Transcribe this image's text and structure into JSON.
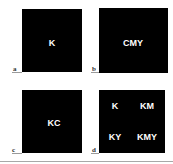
{
  "figure": {
    "background": "#ffffff",
    "panel_color": "#000000",
    "text_color": "#ffffff",
    "panels": [
      {
        "id": "a",
        "label": "a",
        "inks": [
          {
            "text": "K"
          }
        ]
      },
      {
        "id": "b",
        "label": "b",
        "inks": [
          {
            "text": "CMY"
          }
        ]
      },
      {
        "id": "c",
        "label": "c",
        "inks": [
          {
            "text": "KC"
          }
        ]
      },
      {
        "id": "d",
        "label": "d",
        "inks": [
          {
            "text": "K"
          },
          {
            "text": "KM"
          },
          {
            "text": "KY"
          },
          {
            "text": "KMY"
          }
        ]
      }
    ]
  }
}
